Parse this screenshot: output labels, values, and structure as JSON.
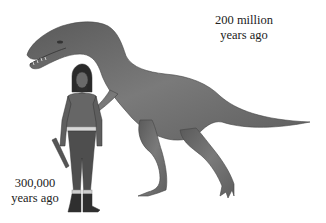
{
  "scene": {
    "description": "Illustration comparing a prehistoric human and a dinosaur",
    "background": "#ffffff",
    "figures": [
      {
        "name": "dinosaur",
        "tone": "#6b6b6b"
      },
      {
        "name": "caveman",
        "tone": "#555555"
      }
    ]
  },
  "labels": {
    "dinosaur": {
      "line1": "200 million",
      "line2": "years ago"
    },
    "human": {
      "line1": "300,000",
      "line2": "years ago"
    }
  }
}
